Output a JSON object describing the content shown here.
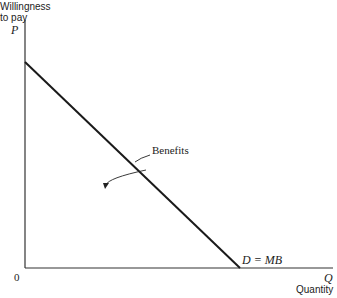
{
  "diagram": {
    "y_axis": {
      "title_line1": "Willingness",
      "title_line2": "to pay",
      "symbol": "P"
    },
    "x_axis": {
      "symbol": "Q",
      "title": "Quantity"
    },
    "origin_label": "0",
    "curve_label": "D = MB",
    "annotation": "Benefits",
    "colors": {
      "line": "#1a1a1a",
      "axis": "#333333",
      "background": "#ffffff"
    }
  }
}
